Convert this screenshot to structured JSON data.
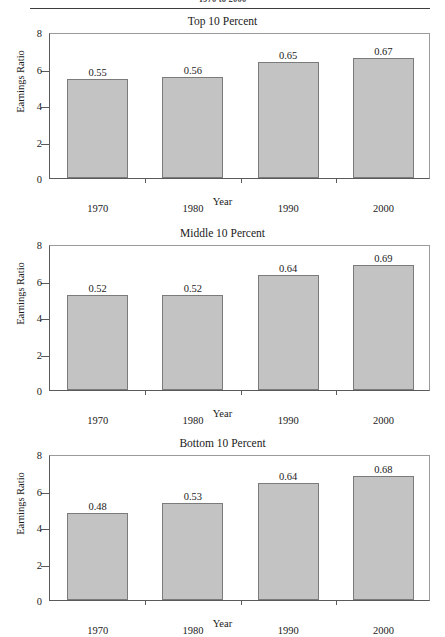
{
  "header": {
    "text": "1970 to 2000",
    "rule": true
  },
  "axis": {
    "ylabel": "Earnings Ratio",
    "xlabel": "Year",
    "yticks": [
      0,
      2,
      4,
      6,
      8
    ],
    "ylim": [
      0,
      8
    ],
    "categories": [
      "1970",
      "1980",
      "1990",
      "2000"
    ]
  },
  "colors": {
    "bar_fill": "#c3c3c3",
    "bar_stroke": "#7b7b7b",
    "axis": "#5a5a5a",
    "text": "#1a1a1a"
  },
  "chart_data": [
    {
      "type": "bar",
      "title": "Top 10 Percent",
      "xlabel": "Year",
      "ylabel": "Earnings Ratio",
      "ylim": [
        0,
        8
      ],
      "yticks": [
        0,
        2,
        4,
        6,
        8
      ],
      "grid": false,
      "legend": false,
      "categories": [
        "1970",
        "1980",
        "1990",
        "2000"
      ],
      "values": [
        5.4,
        5.55,
        6.35,
        6.6
      ],
      "data_labels": [
        "0.55",
        "0.56",
        "0.65",
        "0.67"
      ]
    },
    {
      "type": "bar",
      "title": "Middle 10 Percent",
      "xlabel": "Year",
      "ylabel": "Earnings Ratio",
      "ylim": [
        0,
        8
      ],
      "yticks": [
        0,
        2,
        4,
        6,
        8
      ],
      "grid": false,
      "legend": false,
      "categories": [
        "1970",
        "1980",
        "1990",
        "2000"
      ],
      "values": [
        5.2,
        5.2,
        6.3,
        6.85
      ],
      "data_labels": [
        "0.52",
        "0.52",
        "0.64",
        "0.69"
      ]
    },
    {
      "type": "bar",
      "title": "Bottom 10 Percent",
      "xlabel": "Year",
      "ylabel": "Earnings Ratio",
      "ylim": [
        0,
        8
      ],
      "yticks": [
        0,
        2,
        4,
        6,
        8
      ],
      "grid": false,
      "legend": false,
      "categories": [
        "1970",
        "1980",
        "1990",
        "2000"
      ],
      "values": [
        4.75,
        5.3,
        6.4,
        6.8
      ],
      "data_labels": [
        "0.48",
        "0.53",
        "0.64",
        "0.68"
      ]
    }
  ]
}
